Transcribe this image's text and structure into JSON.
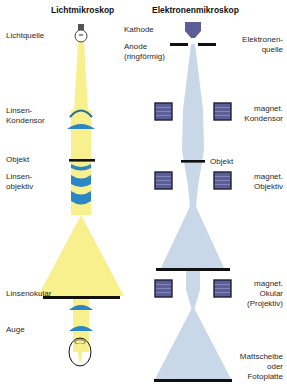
{
  "light_microscope": {
    "title": "Lichtmikroskop",
    "labels": {
      "source": "Lichtquelle",
      "condenser_1": "Linsen-",
      "condenser_2": "Kondensor",
      "object": "Objekt",
      "objective_1": "Linsen-",
      "objective_2": "objektiv",
      "eyepiece": "Linsenokular",
      "eye": "Auge"
    }
  },
  "electron_microscope": {
    "title": "Elektronenmikroskop",
    "labels": {
      "cathode": "Kathode",
      "anode_1": "Anode",
      "anode_2": "(ringförmig)",
      "source_1": "Elektronen-",
      "source_2": "quelle",
      "condenser_1": "magnet.",
      "condenser_2": "Kondensor",
      "object": "Objekt",
      "objective_1": "magnet.",
      "objective_2": "Objektiv",
      "ocular_1": "magnet.",
      "ocular_2": "Okular",
      "ocular_3": "(Projektiv)",
      "screen_1": "Mattscheibe",
      "screen_2": "oder",
      "screen_3": "Fotoplatte"
    }
  },
  "colors": {
    "light_beam": "#f7f08c",
    "electron_beam": "#c9d8e8",
    "glass_lens": "#2a86c4",
    "magnet_coil": "#5c5f96",
    "magnet_border": "#1e1e3a",
    "plate": "#111111"
  }
}
